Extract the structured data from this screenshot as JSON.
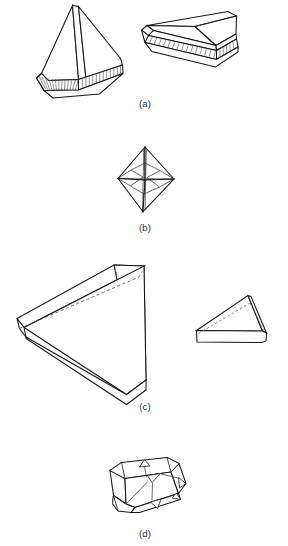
{
  "figure": {
    "background_color": "#ffffff",
    "ink_color": "#15161a",
    "hidden_edge_color": "#4a4b52",
    "width": 288,
    "height": 546,
    "panels": [
      {
        "id": "a",
        "caption": "(a)",
        "caption_x": 145,
        "caption_y": 107,
        "description": "Two tetragonal pyramid crystals with striated basal bands",
        "objects": [
          {
            "name": "steep-pyramid-on-striated-base",
            "position": "left"
          },
          {
            "name": "flat-pyramid-on-striated-base",
            "position": "right"
          }
        ]
      },
      {
        "id": "b",
        "caption": "(b)",
        "caption_x": 145,
        "caption_y": 231,
        "description": "Dipyramid (octahedral) crystal with inner bipyramid edges",
        "objects": [
          {
            "name": "dipyramid-crystal",
            "position": "center"
          }
        ]
      },
      {
        "id": "c",
        "caption": "(c)",
        "caption_x": 145,
        "caption_y": 410,
        "description": "Two tabular wedge crystals drawn with dashed hidden edges",
        "objects": [
          {
            "name": "large-wedge-tablet",
            "position": "left"
          },
          {
            "name": "small-wedge-tablet",
            "position": "right"
          }
        ]
      },
      {
        "id": "d",
        "caption": "(d)",
        "caption_x": 145,
        "caption_y": 537,
        "description": "Cubo-octahedral crystal with truncated triangular corner facets",
        "objects": [
          {
            "name": "truncated-cube-crystal",
            "position": "center"
          }
        ]
      }
    ]
  }
}
